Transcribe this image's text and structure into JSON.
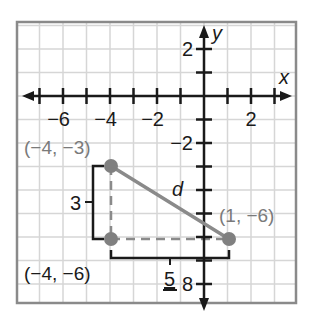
{
  "axes": {
    "x_label": "x",
    "y_label": "y",
    "x_ticks": [
      {
        "value": -6,
        "label": "−6"
      },
      {
        "value": -4,
        "label": "−4"
      },
      {
        "value": -2,
        "label": "−2"
      },
      {
        "value": 2,
        "label": "2"
      }
    ],
    "y_ticks": [
      {
        "value": 2,
        "label": "2"
      },
      {
        "value": -2,
        "label": "−2"
      },
      {
        "value": -8,
        "label": "8"
      }
    ],
    "x_range": [
      -8,
      4
    ],
    "y_range": [
      -9,
      3
    ]
  },
  "points": [
    {
      "id": "A",
      "label": "(−4, −3)",
      "x": -4,
      "y": -3
    },
    {
      "id": "B",
      "label": "(−4, −6)",
      "x": -4,
      "y": -6
    },
    {
      "id": "C",
      "label": "(1, −6)",
      "x": 1,
      "y": -6
    }
  ],
  "segments": {
    "hypotenuse_label": "d",
    "vertical_leg_label": "3",
    "horizontal_leg_label": "5"
  },
  "colors": {
    "grid": "#d6d6d6",
    "frame": "#8a8a8a",
    "axis": "#1a1a1a",
    "point": "#808080",
    "segment": "#8a8a8a",
    "point_label": "#7a7a7a"
  }
}
